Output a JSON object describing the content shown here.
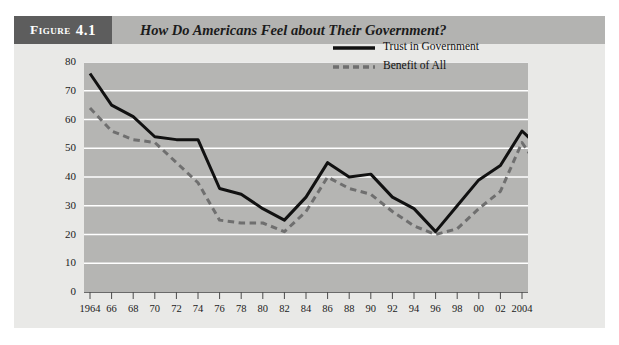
{
  "figure": {
    "badge_word": "Figure",
    "badge_number": "4.1",
    "title": "How Do Americans Feel about Their Government?"
  },
  "legend": {
    "items": [
      {
        "label": "Trust in Government",
        "style": "solid",
        "color": "#111111"
      },
      {
        "label": "Benefit of All",
        "style": "dashed",
        "color": "#6f6f6f"
      }
    ]
  },
  "axis": {
    "y_ticks": [
      "80",
      "70",
      "60",
      "50",
      "40",
      "30",
      "20",
      "10",
      "0"
    ],
    "x_ticks": [
      "1964",
      "66",
      "68",
      "70",
      "72",
      "74",
      "76",
      "78",
      "80",
      "82",
      "84",
      "86",
      "88",
      "90",
      "92",
      "94",
      "96",
      "98",
      "00",
      "02",
      "2004"
    ]
  },
  "colors": {
    "page": "#ffffff",
    "panel": "#e9e9e7",
    "header_bar": "#b3b3b1",
    "badge": "#5d5d5d",
    "plot_bg": "#b5b5b3",
    "gridline": "#ffffff",
    "trust_line": "#111111",
    "benefit_line": "#6f6f6f"
  },
  "chart_data": {
    "type": "line",
    "title": "How Do Americans Feel about Their Government?",
    "xlabel": "",
    "ylabel": "",
    "ylim": [
      0,
      80
    ],
    "ytick_step": 10,
    "grid": true,
    "legend_position": "top-right",
    "x": [
      "1964",
      "1966",
      "1968",
      "1970",
      "1972",
      "1974",
      "1976",
      "1978",
      "1980",
      "1982",
      "1984",
      "1986",
      "1988",
      "1990",
      "1992",
      "1994",
      "1996",
      "1998",
      "2000",
      "2002",
      "2004"
    ],
    "x_tick_labels": [
      "1964",
      "66",
      "68",
      "70",
      "72",
      "74",
      "76",
      "78",
      "80",
      "82",
      "84",
      "86",
      "88",
      "90",
      "92",
      "94",
      "96",
      "98",
      "00",
      "02",
      "2004"
    ],
    "series": [
      {
        "name": "Trust in Government",
        "style": "solid",
        "color": "#111111",
        "values": [
          76,
          65,
          61,
          54,
          53,
          53,
          36,
          34,
          29,
          25,
          33,
          45,
          40,
          41,
          33,
          29,
          21,
          30,
          39,
          44,
          56
        ]
      },
      {
        "name": "Benefit of All",
        "style": "dashed",
        "color": "#6f6f6f",
        "values": [
          64,
          56,
          53,
          52,
          45,
          38,
          25,
          24,
          24,
          21,
          28,
          40,
          36,
          34,
          28,
          23,
          20,
          22,
          29,
          35,
          52
        ]
      }
    ],
    "final_point": {
      "x": "2004",
      "trust": 49,
      "benefit": 41
    }
  },
  "caption": {
    "text": ""
  }
}
